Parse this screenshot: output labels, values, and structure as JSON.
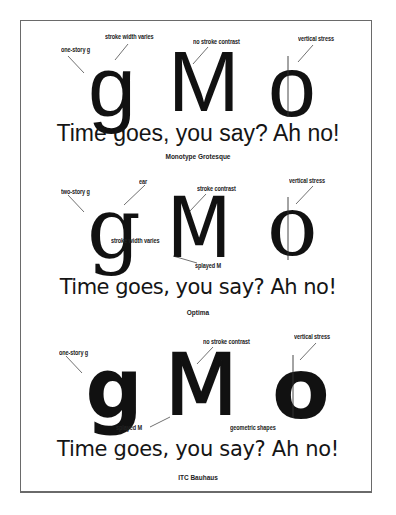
{
  "diagram": {
    "sections": [
      {
        "typeface": "Monotype Grotesque",
        "glyphs": [
          "g",
          "M",
          "o"
        ],
        "sample": "Time goes, you say? Ah no!",
        "annotations": {
          "g_story": "one-story g",
          "stroke": "stroke width varies",
          "contrast": "no stroke contrast",
          "stress": "vertical stress"
        }
      },
      {
        "typeface": "Optima",
        "glyphs": [
          "g",
          "M",
          "o"
        ],
        "sample": "Time goes, you say? Ah no!",
        "annotations": {
          "g_story": "two-story g",
          "ear": "ear",
          "contrast": "stroke contrast",
          "stroke": "stroke width varies",
          "splayed": "splayed M",
          "stress": "vertical stress"
        }
      },
      {
        "typeface": "ITC Bauhaus",
        "glyphs": [
          "g",
          "M",
          "o"
        ],
        "sample": "Time goes, you say? Ah no!",
        "annotations": {
          "g_story": "one-story g",
          "contrast": "no stroke contrast",
          "stress": "vertical stress",
          "splayed": "splayed M",
          "geometric": "geometric shapes"
        }
      }
    ]
  }
}
